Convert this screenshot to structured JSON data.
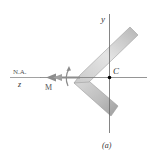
{
  "figure": {
    "caption": "(a)",
    "labels": {
      "y_axis": "y",
      "centroid": "C",
      "neutral_axis": "N.A.",
      "z_axis": "z",
      "moment": "M"
    },
    "colors": {
      "axis": "#666666",
      "section_fill_light": "#e2e2e2",
      "section_fill_dark": "#a8a8a8",
      "section_edge": "#8a8a8a",
      "moment_arrow": "#8c8c8c",
      "centroid_dot": "#000000"
    }
  }
}
